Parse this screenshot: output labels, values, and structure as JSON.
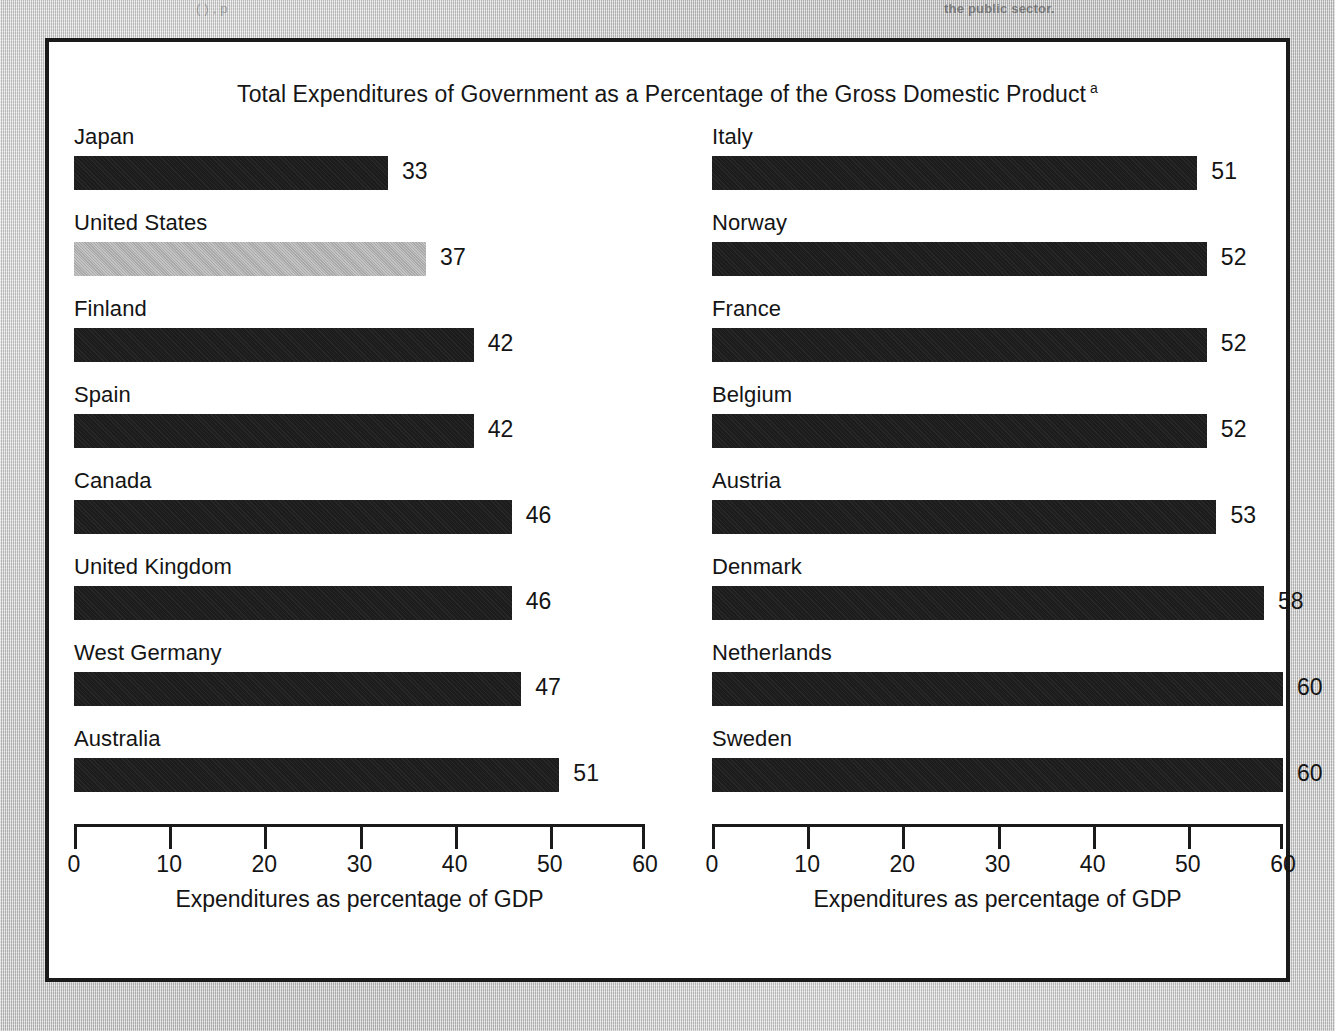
{
  "background": {
    "bleed_text_left": "(            ) ,    p",
    "bleed_text_mid": "",
    "bleed_text_right": "the public sector."
  },
  "figure": {
    "title": "Total Expenditures of Government as a Percentage of the Gross Domestic Product",
    "title_footnote_marker": "a",
    "axis_title": "Expenditures as percentage of GDP",
    "highlight_color": "#a9a9a9",
    "bar_color": "#1c1c1c",
    "frame_color": "#1a1a1a"
  },
  "chart_data": {
    "type": "bar",
    "orientation": "horizontal",
    "title": "Total Expenditures of Government as a Percentage of the Gross Domestic Product",
    "xlabel": "Expenditures as percentage of GDP",
    "ylabel": "",
    "xlim": [
      0,
      60
    ],
    "xticks": [
      0,
      10,
      20,
      30,
      40,
      50,
      60
    ],
    "xtick_labels": [
      "0",
      "10",
      "20",
      "30",
      "40",
      "50",
      "60"
    ],
    "grid": false,
    "legend": null,
    "highlighted_category": "United States",
    "panels": [
      {
        "name": "left-panel",
        "categories": [
          "Japan",
          "United States",
          "Finland",
          "Spain",
          "Canada",
          "United Kingdom",
          "West Germany",
          "Australia"
        ],
        "values": [
          33,
          37,
          42,
          42,
          46,
          46,
          47,
          51
        ],
        "highlight": [
          false,
          true,
          false,
          false,
          false,
          false,
          false,
          false
        ],
        "xlabel": "Expenditures as percentage of GDP",
        "xticks": [
          0,
          10,
          20,
          30,
          40,
          50,
          60
        ]
      },
      {
        "name": "right-panel",
        "categories": [
          "Italy",
          "Norway",
          "France",
          "Belgium",
          "Austria",
          "Denmark",
          "Netherlands",
          "Sweden"
        ],
        "values": [
          51,
          52,
          52,
          52,
          53,
          58,
          60,
          60
        ],
        "highlight": [
          false,
          false,
          false,
          false,
          false,
          false,
          false,
          false
        ],
        "xlabel": "Expenditures as percentage of GDP",
        "xticks": [
          0,
          10,
          20,
          30,
          40,
          50,
          60
        ]
      }
    ]
  }
}
